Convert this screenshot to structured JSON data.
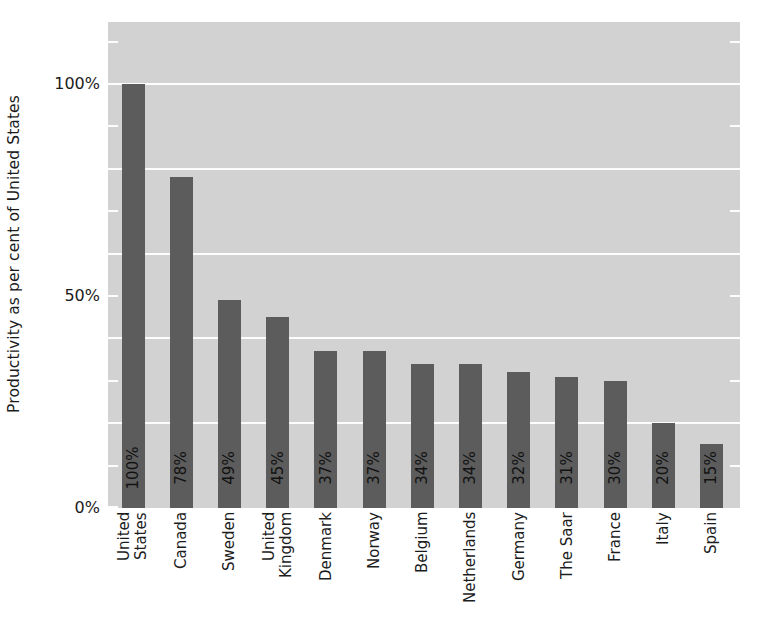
{
  "chart_data": {
    "type": "bar",
    "title": "",
    "xlabel": "",
    "ylabel": "Productivity as per cent of United States",
    "ylim": [
      0,
      114
    ],
    "ytick_labels": [
      "100%",
      "50%",
      "0%"
    ],
    "ytick_values": [
      100,
      50,
      0
    ],
    "gridlines": [
      100,
      80,
      60,
      40,
      20
    ],
    "minor_ticks": [
      110,
      90,
      70,
      50,
      30,
      10
    ],
    "grid": true,
    "legend": "none",
    "bar_color": "#5c5c5c",
    "plot_background": "#d2d2d2",
    "grid_color": "#fdfdfd",
    "categories": [
      "United States",
      "Canada",
      "Sweden",
      "United Kingdom",
      "Denmark",
      "Norway",
      "Belgium",
      "Netherlands",
      "Germany",
      "The Saar",
      "France",
      "Italy",
      "Spain"
    ],
    "category_lines": [
      [
        "United",
        "States"
      ],
      [
        "Canada"
      ],
      [
        "Sweden"
      ],
      [
        "United",
        "Kingdom"
      ],
      [
        "Denmark"
      ],
      [
        "Norway"
      ],
      [
        "Belgium"
      ],
      [
        "Netherlands"
      ],
      [
        "Germany"
      ],
      [
        "The Saar"
      ],
      [
        "France"
      ],
      [
        "Italy"
      ],
      [
        "Spain"
      ]
    ],
    "values": [
      100,
      78,
      49,
      45,
      37,
      37,
      34,
      34,
      32,
      31,
      30,
      20,
      15
    ],
    "value_labels": [
      "100%",
      "78%",
      "49%",
      "45%",
      "37%",
      "37%",
      "34%",
      "34%",
      "32%",
      "31%",
      "30%",
      "20%",
      "15%"
    ]
  }
}
